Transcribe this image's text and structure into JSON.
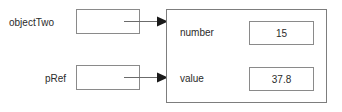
{
  "diagram": {
    "stroke_color": "#8a8a8a",
    "panel_stroke_color": "#7d7d7d",
    "text_color": "#2b2b2b",
    "background_color": "#ffffff"
  },
  "references": [
    {
      "label": "objectTwo",
      "box_value": "",
      "arrow_icon": "arrow-right-icon",
      "points_to": "object-panel"
    },
    {
      "label": "pRef",
      "box_value": "",
      "arrow_icon": "arrow-right-icon",
      "points_to": "object-panel"
    }
  ],
  "object_panel": {
    "fields": [
      {
        "name": "number",
        "value": "15"
      },
      {
        "name": "value",
        "value": "37.8"
      }
    ]
  }
}
